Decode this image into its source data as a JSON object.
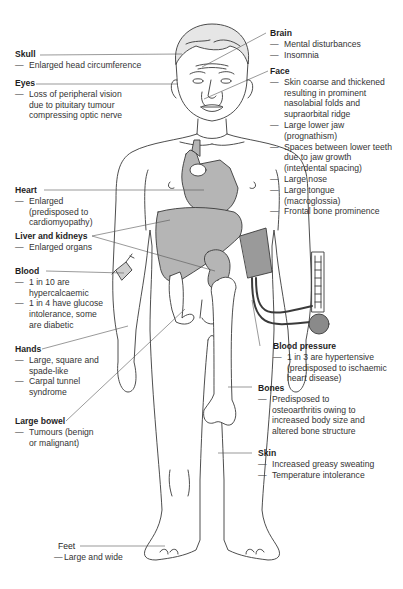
{
  "diagram": {
    "type": "anatomical-annotated-figure",
    "colors": {
      "outline": "#3a3a3a",
      "organ_fill": "#b5b5b5",
      "leader_line": "#555555",
      "background": "#ffffff"
    },
    "labels": [
      {
        "id": "skull",
        "title": "Skull",
        "items": [
          "Enlarged head circumference"
        ]
      },
      {
        "id": "eyes",
        "title": "Eyes",
        "items": [
          "Loss of peripheral vision due to pituitary tumour compressing optic nerve"
        ]
      },
      {
        "id": "brain",
        "title": "Brain",
        "items": [
          "Mental disturbances",
          "Insomnia"
        ]
      },
      {
        "id": "face",
        "title": "Face",
        "items": [
          "Skin coarse and thickened resulting in prominent nasolabial folds and supraorbital ridge",
          "Large lower jaw (prognathism)",
          "Spaces between lower teeth due to jaw growth (interdental spacing)",
          "Large nose",
          "Large tongue (macroglossia)",
          "Frontal bone prominence"
        ]
      },
      {
        "id": "heart",
        "title": "Heart",
        "items": [
          "Enlarged (predisposed to cardiomyopathy)"
        ]
      },
      {
        "id": "liver_kidneys",
        "title": "Liver and kidneys",
        "items": [
          "Enlarged organs"
        ]
      },
      {
        "id": "blood",
        "title": "Blood",
        "items": [
          "1 in 10 are hypercalcaemic",
          "1 in 4 have glucose intolerance, some are diabetic"
        ]
      },
      {
        "id": "hands",
        "title": "Hands",
        "items": [
          "Large, square and spade-like",
          "Carpal tunnel syndrome"
        ]
      },
      {
        "id": "large_bowel",
        "title": "Large bowel",
        "items": [
          "Tumours (benign or malignant)"
        ]
      },
      {
        "id": "blood_pressure",
        "title": "Blood pressure",
        "items": [
          "1 in 3 are hypertensive (predisposed to ischaemic heart disease)"
        ]
      },
      {
        "id": "bones",
        "title": "Bones",
        "items": [
          "Predisposed to osteoarthritis owing to increased body size and altered bone structure"
        ]
      },
      {
        "id": "skin",
        "title": "Skin",
        "items": [
          "Increased greasy sweating",
          "Temperature intolerance"
        ]
      },
      {
        "id": "feet",
        "title": "Feet",
        "items": [
          "Large and wide"
        ]
      }
    ]
  }
}
